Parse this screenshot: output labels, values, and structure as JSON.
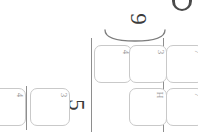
{
  "page": {
    "background_color": "#ffffff",
    "width": 198,
    "height": 134,
    "orientation_note": "sideways"
  },
  "colors": {
    "card_border": "#c9c9c9",
    "card_fill": "#ffffff",
    "rule": "#8e8e8e",
    "numeral": "#3b3b3b",
    "glyph": "#9a9a9a",
    "badge": "#4a4a4a"
  },
  "badge": {
    "name": "circle-badge",
    "label": ""
  },
  "brace": {
    "name": "group-brace",
    "label": ""
  },
  "numerals": [
    {
      "id": "five",
      "value": "5"
    },
    {
      "id": "nine",
      "value": "9"
    }
  ],
  "cards": [
    {
      "id": "card-1",
      "glyph": "4",
      "row": "bottom-left",
      "x": -14,
      "y": 88,
      "w": 40,
      "h": 38,
      "clipped": true
    },
    {
      "id": "card-2",
      "glyph": "3",
      "row": "bottom-left",
      "x": 30,
      "y": 88,
      "w": 40,
      "h": 38,
      "clipped": false
    },
    {
      "id": "card-3",
      "glyph": "4",
      "row": "top",
      "x": 94,
      "y": 45,
      "w": 38,
      "h": 38,
      "clipped": false
    },
    {
      "id": "card-4",
      "glyph": "3",
      "row": "top",
      "x": 129,
      "y": 45,
      "w": 38,
      "h": 38,
      "clipped": false
    },
    {
      "id": "card-5",
      "glyph": "7",
      "row": "top",
      "x": 166,
      "y": 45,
      "w": 38,
      "h": 38,
      "clipped": true
    },
    {
      "id": "card-6",
      "glyph": "H",
      "row": "bottom",
      "x": 129,
      "y": 88,
      "w": 38,
      "h": 38,
      "clipped": false
    },
    {
      "id": "card-7",
      "glyph": "7",
      "row": "bottom",
      "x": 166,
      "y": 88,
      "w": 38,
      "h": 38,
      "clipped": true
    }
  ],
  "rules": [
    {
      "id": "rule-left",
      "x": 26,
      "y": 86,
      "h": 44
    },
    {
      "id": "rule-mid",
      "x": 91,
      "y": 38,
      "h": 94
    },
    {
      "id": "rule-right",
      "x": 163,
      "y": 38,
      "h": 94
    }
  ]
}
